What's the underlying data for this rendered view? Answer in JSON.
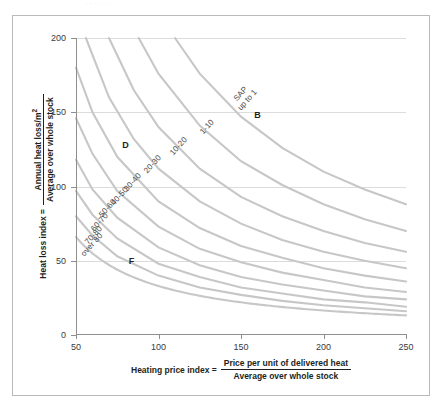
{
  "top_artifact": "· · · · · ·",
  "chart_data": {
    "type": "line",
    "title": "",
    "subtitle": "",
    "xlabel_parts": {
      "lead": "Heating price index =",
      "numerator": "Price per unit of delivered heat",
      "denominator": "Average over whole stock"
    },
    "ylabel_parts": {
      "lead": "Heat loss index =",
      "numerator": "Annual heat loss/m",
      "numerator_sup": "2",
      "denominator": "Average over whole stock"
    },
    "xlim": [
      50,
      250
    ],
    "ylim": [
      0,
      200
    ],
    "xticks": [
      50,
      100,
      150,
      200,
      250
    ],
    "yticks": [
      0,
      50,
      100,
      150,
      200
    ],
    "grid": "horizontal",
    "grid_values": [
      50,
      100,
      150,
      200
    ],
    "legend_position": "inline-curve-labels",
    "curve_color": "#c7c7c7",
    "note": "Each curve is an iso-SAP contour of the form y = k / x; labels sit along the curves.",
    "series": [
      {
        "name": "SAP up to 1",
        "label": "SAP\nup to 1",
        "label_lines": [
          "SAP",
          "up to 1"
        ],
        "k": 22000,
        "points_xy": [
          [
            110,
            200
          ],
          [
            125,
            176
          ],
          [
            150,
            147
          ],
          [
            175,
            126
          ],
          [
            200,
            110
          ],
          [
            225,
            98
          ],
          [
            250,
            88
          ]
        ],
        "label_at": [
          143,
          158
        ],
        "label_rotation": -48
      },
      {
        "name": "1-10",
        "label": "1-10",
        "label_lines": [
          "1-10"
        ],
        "k": 17600,
        "points_xy": [
          [
            88,
            200
          ],
          [
            100,
            176
          ],
          [
            125,
            141
          ],
          [
            150,
            117
          ],
          [
            175,
            101
          ],
          [
            200,
            88
          ],
          [
            225,
            78
          ],
          [
            250,
            70
          ]
        ],
        "label_at": [
          124,
          138
        ],
        "label_rotation": -48
      },
      {
        "name": "10-20",
        "label": "10-20",
        "label_lines": [
          "10-20"
        ],
        "k": 14000,
        "points_xy": [
          [
            70,
            200
          ],
          [
            85,
            165
          ],
          [
            100,
            140
          ],
          [
            125,
            112
          ],
          [
            150,
            93
          ],
          [
            175,
            80
          ],
          [
            200,
            70
          ],
          [
            225,
            62
          ],
          [
            250,
            56
          ]
        ],
        "label_at": [
          106,
          124
        ],
        "label_rotation": -48
      },
      {
        "name": "20-30",
        "label": "20-30",
        "label_lines": [
          "20-30"
        ],
        "k": 11200,
        "points_xy": [
          [
            56,
            200
          ],
          [
            70,
            160
          ],
          [
            85,
            132
          ],
          [
            100,
            112
          ],
          [
            125,
            90
          ],
          [
            150,
            75
          ],
          [
            175,
            64
          ],
          [
            200,
            56
          ],
          [
            225,
            50
          ],
          [
            250,
            45
          ]
        ],
        "label_at": [
          90,
          112
        ],
        "label_rotation": -48
      },
      {
        "name": "30-40",
        "label": "30-40",
        "label_lines": [
          "30-40"
        ],
        "k": 9000,
        "points_xy": [
          [
            50,
            180
          ],
          [
            60,
            150
          ],
          [
            75,
            120
          ],
          [
            100,
            90
          ],
          [
            125,
            72
          ],
          [
            150,
            60
          ],
          [
            175,
            52
          ],
          [
            200,
            45
          ],
          [
            225,
            40
          ],
          [
            250,
            36
          ]
        ],
        "label_at": [
          78,
          100
        ],
        "label_rotation": -48
      },
      {
        "name": "40-50",
        "label": "40-50",
        "label_lines": [
          "40-50"
        ],
        "k": 7300,
        "points_xy": [
          [
            50,
            146
          ],
          [
            60,
            122
          ],
          [
            75,
            97
          ],
          [
            100,
            73
          ],
          [
            125,
            58
          ],
          [
            150,
            49
          ],
          [
            175,
            42
          ],
          [
            200,
            37
          ],
          [
            225,
            32
          ],
          [
            250,
            29
          ]
        ],
        "label_at": [
          70,
          90
        ],
        "label_rotation": -48
      },
      {
        "name": "50-60",
        "label": "50-60",
        "label_lines": [
          "50-60"
        ],
        "k": 5900,
        "points_xy": [
          [
            50,
            118
          ],
          [
            60,
            98
          ],
          [
            75,
            79
          ],
          [
            100,
            59
          ],
          [
            125,
            47
          ],
          [
            150,
            39
          ],
          [
            175,
            34
          ],
          [
            200,
            30
          ],
          [
            225,
            26
          ],
          [
            250,
            24
          ]
        ],
        "label_at": [
          63,
          82
        ],
        "label_rotation": -48
      },
      {
        "name": "60-70",
        "label": "60-70",
        "label_lines": [
          "60-70"
        ],
        "k": 4850,
        "points_xy": [
          [
            50,
            97
          ],
          [
            60,
            81
          ],
          [
            75,
            65
          ],
          [
            100,
            48
          ],
          [
            125,
            39
          ],
          [
            150,
            32
          ],
          [
            175,
            28
          ],
          [
            200,
            24
          ],
          [
            225,
            22
          ],
          [
            250,
            19
          ]
        ],
        "label_at": [
          58,
          73
        ],
        "label_rotation": -48
      },
      {
        "name": "70-80",
        "label": "70-80",
        "label_lines": [
          "70-80"
        ],
        "k": 4000,
        "points_xy": [
          [
            50,
            80
          ],
          [
            60,
            67
          ],
          [
            75,
            53
          ],
          [
            100,
            40
          ],
          [
            125,
            32
          ],
          [
            150,
            27
          ],
          [
            175,
            23
          ],
          [
            200,
            20
          ],
          [
            225,
            18
          ],
          [
            250,
            16
          ]
        ],
        "label_at": [
          54,
          64
        ],
        "label_rotation": -48
      },
      {
        "name": "over 80",
        "label": "over 80",
        "label_lines": [
          "over 80"
        ],
        "k": 0,
        "points_xy": [],
        "label_at": [
          52,
          56
        ],
        "label_rotation": -48
      }
    ],
    "rating_annotations": [
      {
        "letter": "B",
        "x": 158,
        "y": 148
      },
      {
        "letter": "D",
        "x": 78,
        "y": 128
      },
      {
        "letter": "F",
        "x": 82,
        "y": 50
      }
    ]
  }
}
